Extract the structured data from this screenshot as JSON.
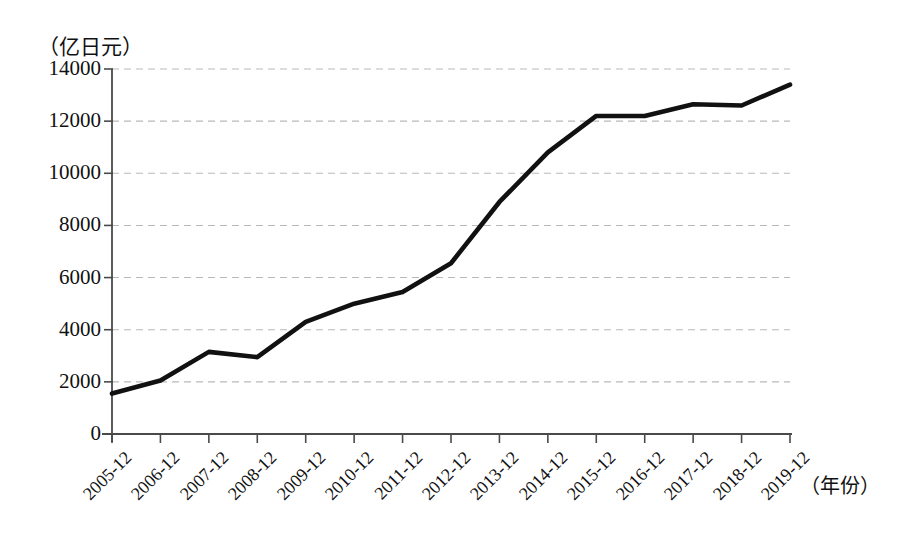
{
  "chart_data": {
    "type": "line",
    "title": "",
    "subtitle": "",
    "xlabel": "（年份）",
    "ylabel": "（亿日元）",
    "categories": [
      "2005-12",
      "2006-12",
      "2007-12",
      "2008-12",
      "2009-12",
      "2010-12",
      "2011-12",
      "2012-12",
      "2013-12",
      "2014-12",
      "2015-12",
      "2016-12",
      "2017-12",
      "2018-12",
      "2019-12"
    ],
    "values": [
      1550,
      2050,
      3150,
      2950,
      4300,
      5000,
      5450,
      6550,
      8900,
      10800,
      12200,
      12200,
      12650,
      12600,
      13400
    ],
    "series": [
      {
        "name": "",
        "values": [
          1550,
          2050,
          3150,
          2950,
          4300,
          5000,
          5450,
          6550,
          8900,
          10800,
          12200,
          12200,
          12650,
          12600,
          13400
        ]
      }
    ],
    "ylim": [
      0,
      14000
    ],
    "yticks": [
      0,
      2000,
      4000,
      6000,
      8000,
      10000,
      12000,
      14000
    ],
    "ytick_labels": [
      "0",
      "2000",
      "4000",
      "6000",
      "8000",
      "10000",
      "12000",
      "14000"
    ],
    "grid": "horizontal-dashed",
    "legend": "none",
    "line_color": "#111111",
    "grid_color": "#b9b9b9",
    "axis_color": "#4a4a4a",
    "background_color": "#ffffff",
    "annotations": []
  }
}
